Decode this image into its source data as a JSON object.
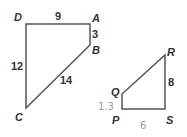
{
  "diagram": {
    "figure1": {
      "vertices": {
        "D": "D",
        "A": "A",
        "B": "B",
        "C": "C"
      },
      "sides": {
        "DA": "9",
        "AB": "3",
        "DC": "12",
        "BC": "14"
      }
    },
    "figure2": {
      "vertices": {
        "R": "R",
        "Q": "Q",
        "P": "P",
        "S": "S"
      },
      "sides": {
        "RS": "8"
      },
      "handwritten": {
        "QP": "1.3",
        "PS": "6"
      }
    },
    "colors": {
      "stroke": "#555555",
      "label": "#333333",
      "handwriting": "#9a9a9a"
    }
  }
}
